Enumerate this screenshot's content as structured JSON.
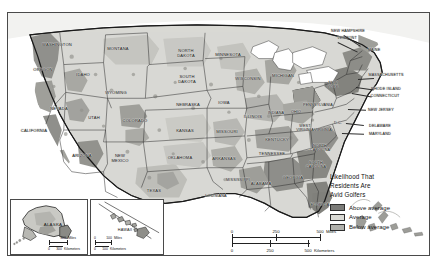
{
  "map": {
    "title_visible": false,
    "projection_note": "contiguous united states choropleth with alaska and hawaii insets",
    "colors": {
      "above_average": "#7b7b78",
      "average": "#d9d9d4",
      "below_average": "#b0b0ab",
      "water": "#ffffff",
      "border": "#2b2b2b",
      "frame": "#4a4a4a"
    },
    "states": [
      {
        "name": "WASHINGTON",
        "x": 49,
        "y": 32,
        "size": "sm"
      },
      {
        "name": "OREGON",
        "x": 35,
        "y": 57,
        "size": "sm"
      },
      {
        "name": "IDAHO",
        "x": 75,
        "y": 62,
        "size": "sm"
      },
      {
        "name": "MONTANA",
        "x": 110,
        "y": 36,
        "size": "sm"
      },
      {
        "name": "NORTH\nDAKOTA",
        "x": 178,
        "y": 41,
        "size": "sm"
      },
      {
        "name": "SOUTH\nDAKOTA",
        "x": 179,
        "y": 67,
        "size": "sm"
      },
      {
        "name": "MINNESOTA",
        "x": 220,
        "y": 42,
        "size": "sm"
      },
      {
        "name": "WISCONSIN",
        "x": 240,
        "y": 66,
        "size": "sm"
      },
      {
        "name": "MICHIGAN",
        "x": 275,
        "y": 63,
        "size": "sm"
      },
      {
        "name": "WYOMING",
        "x": 108,
        "y": 80,
        "size": "sm"
      },
      {
        "name": "NEBRASKA",
        "x": 180,
        "y": 92,
        "size": "sm"
      },
      {
        "name": "IOWA",
        "x": 216,
        "y": 90,
        "size": "sm"
      },
      {
        "name": "ILLINOIS",
        "x": 245,
        "y": 104,
        "size": "sm"
      },
      {
        "name": "INDIANA",
        "x": 268,
        "y": 100,
        "size": "tiny"
      },
      {
        "name": "OHIO",
        "x": 288,
        "y": 99,
        "size": "tiny"
      },
      {
        "name": "NEVADA",
        "x": 51,
        "y": 96,
        "size": "sm"
      },
      {
        "name": "UTAH",
        "x": 86,
        "y": 105,
        "size": "sm"
      },
      {
        "name": "CALIFORNIA",
        "x": 26,
        "y": 118,
        "size": "sm"
      },
      {
        "name": "COLORADO",
        "x": 127,
        "y": 108,
        "size": "sm"
      },
      {
        "name": "KANSAS",
        "x": 177,
        "y": 118,
        "size": "sm"
      },
      {
        "name": "MISSOURI",
        "x": 219,
        "y": 119,
        "size": "sm"
      },
      {
        "name": "KENTUCKY",
        "x": 269,
        "y": 127,
        "size": "sm"
      },
      {
        "name": "WEST\nVIRGINIA",
        "x": 297,
        "y": 115,
        "size": "tiny"
      },
      {
        "name": "VIRGINIA",
        "x": 315,
        "y": 117,
        "size": "tiny"
      },
      {
        "name": "ARIZONA",
        "x": 74,
        "y": 143,
        "size": "sm"
      },
      {
        "name": "NEW\nMEXICO",
        "x": 112,
        "y": 146,
        "size": "sm"
      },
      {
        "name": "OKLAHOMA",
        "x": 172,
        "y": 145,
        "size": "sm"
      },
      {
        "name": "ARKANSAS",
        "x": 216,
        "y": 146,
        "size": "sm"
      },
      {
        "name": "TENNESSEE",
        "x": 264,
        "y": 141,
        "size": "sm"
      },
      {
        "name": "NORTH\nCAROLINA",
        "x": 312,
        "y": 135,
        "size": "tiny"
      },
      {
        "name": "SOUTH\nCAROLINA",
        "x": 308,
        "y": 152,
        "size": "tiny"
      },
      {
        "name": "MISSISSIPPI",
        "x": 230,
        "y": 167,
        "size": "tiny"
      },
      {
        "name": "ALABAMA",
        "x": 253,
        "y": 171,
        "size": "sm"
      },
      {
        "name": "GEORGIA",
        "x": 285,
        "y": 165,
        "size": "sm"
      },
      {
        "name": "TEXAS",
        "x": 146,
        "y": 178,
        "size": "sm"
      },
      {
        "name": "LOUISIANA",
        "x": 208,
        "y": 183,
        "size": "tiny"
      },
      {
        "name": "FLORIDA",
        "x": 312,
        "y": 192,
        "size": "sm"
      },
      {
        "name": "PENNSYLVANIA",
        "x": 310,
        "y": 92,
        "size": "tiny"
      },
      {
        "name": "NEW\nYORK",
        "x": 325,
        "y": 72,
        "size": "tiny"
      },
      {
        "name": "MAINE",
        "x": 366,
        "y": 37,
        "size": "tiny"
      }
    ],
    "callout_states": [
      {
        "name": "NEW HAMPSHIRE",
        "x": 340,
        "y": 18,
        "size": "tiny"
      },
      {
        "name": "VERMONT",
        "x": 339,
        "y": 25,
        "size": "tiny"
      },
      {
        "name": "MASSACHUSETTS",
        "x": 378,
        "y": 62,
        "size": "tiny"
      },
      {
        "name": "RHODE ISLAND",
        "x": 378,
        "y": 76,
        "size": "tiny"
      },
      {
        "name": "CONNECTICUT",
        "x": 377,
        "y": 83,
        "size": "tiny"
      },
      {
        "name": "NEW JERSEY",
        "x": 373,
        "y": 97,
        "size": "tiny"
      },
      {
        "name": "DELAWARE",
        "x": 372,
        "y": 113,
        "size": "tiny"
      },
      {
        "name": "MARYLAND",
        "x": 372,
        "y": 121,
        "size": "tiny"
      },
      {
        "name": "D.C.",
        "x": 330,
        "y": 110,
        "size": "tiny"
      }
    ]
  },
  "legend": {
    "title": "Likelihood That\nResidents Are\nAvid Golfers",
    "entries": [
      {
        "label": "Above average",
        "color": "#7b7b78"
      },
      {
        "label": "Average",
        "color": "#d9d9d4"
      },
      {
        "label": "Below average",
        "color": "#b0b0ab"
      }
    ]
  },
  "scale_main": {
    "miles": {
      "ticks": [
        "0",
        "250",
        "500"
      ],
      "unit": "Miles"
    },
    "kilometers": {
      "ticks": [
        "0",
        "250",
        "500"
      ],
      "unit": "Kilometers"
    }
  },
  "inset_alaska": {
    "label": "ALASKA",
    "miles": {
      "ticks": [
        "0",
        "300"
      ],
      "unit": "Miles"
    },
    "kilometers": {
      "ticks": [
        "0",
        "300"
      ],
      "unit": "Kilometers"
    }
  },
  "inset_hawaii": {
    "label": "HAWAII",
    "miles": {
      "ticks": [
        "0",
        "100"
      ],
      "unit": "Miles"
    },
    "kilometers": {
      "ticks": [
        "0",
        "100"
      ],
      "unit": "Kilometers"
    }
  }
}
